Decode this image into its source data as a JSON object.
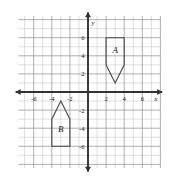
{
  "chart_data": {
    "type": "scatter",
    "title": "",
    "xlabel": "x",
    "ylabel": "y",
    "xlim": [
      -8,
      8
    ],
    "ylim": [
      -8,
      8
    ],
    "grid": true,
    "grid_step": 1,
    "legend": "none",
    "x_tick_labels": [
      "-6",
      "-4",
      "-2",
      "2",
      "4",
      "6"
    ],
    "x_tick_values": [
      -6,
      -4,
      -2,
      2,
      4,
      6
    ],
    "y_tick_labels": [
      "6",
      "4",
      "2",
      "-2",
      "-4",
      "-6"
    ],
    "y_tick_values": [
      6,
      4,
      2,
      -2,
      -4,
      -6
    ],
    "origin_label": "",
    "shapes": [
      {
        "name": "A",
        "label": "A",
        "label_position": [
          3,
          4.3
        ],
        "description": "pentagon pointing down in quadrant I",
        "vertices": [
          [
            2,
            6
          ],
          [
            4,
            6
          ],
          [
            4,
            3
          ],
          [
            3,
            1
          ],
          [
            2,
            3
          ]
        ]
      },
      {
        "name": "B",
        "label": "B",
        "label_position": [
          -3,
          -4.4
        ],
        "description": "pentagon house shape pointing up in quadrant III",
        "vertices": [
          [
            -3,
            -1
          ],
          [
            -2,
            -3
          ],
          [
            -2,
            -6
          ],
          [
            -4,
            -6
          ],
          [
            -4,
            -3
          ]
        ]
      }
    ]
  },
  "axes": {
    "x_axis_name": "x",
    "y_axis_name": "y"
  },
  "colors": {
    "grid_minor": "#c9c9c9",
    "grid_major": "#9a9a9a",
    "axis": "#333333",
    "shape_stroke": "#4a4a4a",
    "background": "#ffffff",
    "text": "#222222"
  }
}
